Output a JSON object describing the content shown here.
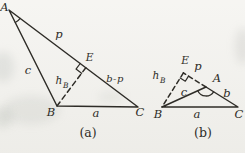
{
  "page": {
    "background_color": "#f3f2ee",
    "ink_color": "#2e2c27"
  },
  "diagram_a": {
    "caption": "(a)",
    "labels": {
      "vertex_A": "A",
      "vertex_B": "B",
      "vertex_C": "C",
      "foot_E": "E",
      "side_AB": "c",
      "side_BC": "a",
      "segment_AE": "p",
      "segment_EC": "b-p",
      "altitude_symbol": "h",
      "altitude_subscript": "B"
    }
  },
  "diagram_b": {
    "caption": "(b)",
    "labels": {
      "vertex_A": "A",
      "vertex_B": "B",
      "vertex_C": "C",
      "foot_E": "E",
      "side_AB": "c",
      "side_AC": "b",
      "side_BC": "a",
      "segment_AE": "p",
      "altitude_symbol": "h",
      "altitude_subscript": "B"
    }
  }
}
